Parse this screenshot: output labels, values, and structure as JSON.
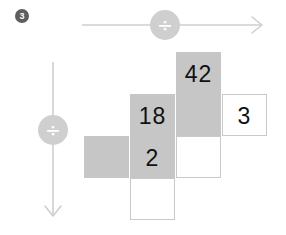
{
  "problem": {
    "number": "3"
  },
  "operators": {
    "horizontal": {
      "symbol": "÷",
      "icon": "divide-icon",
      "direction": "right"
    },
    "vertical": {
      "symbol": "÷",
      "icon": "divide-icon",
      "direction": "down"
    }
  },
  "colors": {
    "shaded_cell": "#c6c6c6",
    "blank_cell_border": "#c9c9c9",
    "arrow": "#cfcfcf",
    "operator_circle": "#cfcfcf",
    "badge": "#5e5e5e",
    "text": "#111111"
  },
  "grid": {
    "columns": 4,
    "rows": 4,
    "cells": [
      {
        "row": 0,
        "col": 2,
        "value": "42",
        "style": "shaded",
        "x": 176,
        "y": 52
      },
      {
        "row": 1,
        "col": 1,
        "value": "18",
        "style": "shaded",
        "x": 130,
        "y": 94
      },
      {
        "row": 1,
        "col": 2,
        "value": "",
        "style": "shaded",
        "x": 176,
        "y": 94
      },
      {
        "row": 1,
        "col": 3,
        "value": "3",
        "style": "blank",
        "x": 222,
        "y": 94
      },
      {
        "row": 2,
        "col": 0,
        "value": "",
        "style": "shaded",
        "x": 84,
        "y": 136
      },
      {
        "row": 2,
        "col": 1,
        "value": "2",
        "style": "shaded",
        "x": 130,
        "y": 136
      },
      {
        "row": 2,
        "col": 2,
        "value": "",
        "style": "blank",
        "x": 176,
        "y": 136
      },
      {
        "row": 3,
        "col": 1,
        "value": "",
        "style": "blank",
        "x": 130,
        "y": 178
      }
    ]
  }
}
